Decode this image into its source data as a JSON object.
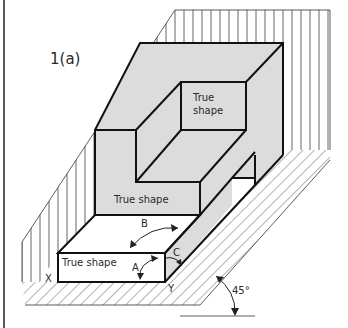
{
  "figure": {
    "label": "1(a)",
    "faces": {
      "top_right_face_label_line1": "True",
      "top_right_face_label_line2": "shape",
      "middle_face_label": "True shape",
      "front_face_label": "True shape"
    },
    "angles": {
      "a": "A",
      "b": "B",
      "c": "C"
    },
    "points": {
      "x": "X",
      "y": "Y"
    },
    "inclination": "45°",
    "colors": {
      "top_faces": "#dcdcdc",
      "true_shape_faces": "#a9a9a9",
      "background": "#ffffff",
      "lines": "#111111"
    }
  }
}
